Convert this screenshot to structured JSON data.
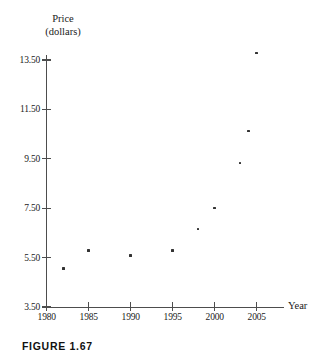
{
  "figure": {
    "caption": "FIGURE 1.67"
  },
  "chart_data": {
    "type": "scatter",
    "title": "",
    "xlabel": "Year",
    "ylabel": "Price (dollars)",
    "ylabel_lines": [
      "Price",
      "(dollars)"
    ],
    "xlim": [
      1980,
      2006.5
    ],
    "ylim": [
      3.5,
      14.3
    ],
    "xticks": [
      1980,
      1985,
      1990,
      1995,
      2000,
      2005
    ],
    "xticklabels": [
      "1980",
      "1985",
      "1990",
      "1995",
      "2000",
      "2005"
    ],
    "yticks": [
      3.5,
      5.5,
      7.5,
      9.5,
      11.5,
      13.5
    ],
    "yticklabels": [
      "3.50",
      "5.50",
      "7.50",
      "9.50",
      "11.50",
      "13.50"
    ],
    "grid": false,
    "legend": false,
    "marker": "square",
    "marker_color": "#333333",
    "axis_color": "#4d4d4d",
    "points": [
      {
        "x": 1982,
        "y": 5.05,
        "label": "1982, 5.05"
      },
      {
        "x": 1985,
        "y": 5.78,
        "label": "1985, 5.78"
      },
      {
        "x": 1990,
        "y": 5.58,
        "label": "1990, 5.58"
      },
      {
        "x": 1995,
        "y": 5.78,
        "label": "1995, 5.78"
      },
      {
        "x": 1998,
        "y": 6.66,
        "label": "1998, 6.66"
      },
      {
        "x": 2000,
        "y": 7.51,
        "label": "2000, 7.51"
      },
      {
        "x": 2003,
        "y": 9.33,
        "label": "2003, 9.33"
      },
      {
        "x": 2004,
        "y": 10.62,
        "label": "2004, 10.62"
      },
      {
        "x": 2005,
        "y": 13.78,
        "label": "2005, 13.78"
      }
    ]
  }
}
